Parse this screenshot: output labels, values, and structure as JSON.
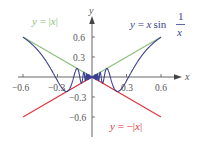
{
  "chart_data": {
    "type": "line",
    "title": "",
    "xlabel": "x",
    "ylabel": "y",
    "xlim": [
      -0.65,
      0.65
    ],
    "ylim": [
      -0.7,
      0.75
    ],
    "grid": false,
    "x_ticks": [
      -0.6,
      -0.3,
      0.3,
      0.6
    ],
    "x_tick_labels": [
      "−0.6",
      "−0.3",
      "0.3",
      "0.6"
    ],
    "y_ticks": [
      0.6,
      0.3,
      -0.3,
      -0.6
    ],
    "y_tick_labels": [
      "0.6",
      "0.3",
      "−0.3",
      "−0.6"
    ],
    "series": [
      {
        "name": "y = |x|",
        "function": "abs(x)",
        "domain": [
          -0.6,
          0.6
        ],
        "color": "#8dc07a"
      },
      {
        "name": "y = −|x|",
        "function": "-abs(x)",
        "domain": [
          -0.6,
          0.6
        ],
        "color": "#e0343c"
      },
      {
        "name": "y = x sin(1/x)",
        "function": "x*sin(1/x)",
        "domain": [
          -0.6,
          0.6
        ],
        "color": "#3a3f8f"
      }
    ],
    "annotations": [
      {
        "text": "y = |x|",
        "color": "#8dc07a",
        "position": "upper-left"
      },
      {
        "text": "y = x sin 1/x",
        "color": "#3a3f8f",
        "position": "upper-right"
      },
      {
        "text": "y = −|x|",
        "color": "#e0343c",
        "position": "lower-right"
      }
    ]
  },
  "labels": {
    "x_axis": "x",
    "y_axis": "y",
    "eq_abs": {
      "y": "y",
      "eq": " = |",
      "x": "x",
      "close": "|"
    },
    "eq_neg_abs": {
      "y": "y",
      "eq": " = −|",
      "x": "x",
      "close": "|"
    },
    "eq_xsin": {
      "y": "y",
      "eq": " = ",
      "x": "x",
      "sin": "sin",
      "num": "1",
      "den": "x"
    },
    "ticks_x": [
      "−0.6",
      "−0.3",
      "0.3",
      "0.6"
    ],
    "ticks_y": [
      "0.6",
      "0.3",
      "−0.3",
      "−0.6"
    ]
  },
  "colors": {
    "abs": "#8dc07a",
    "neg_abs": "#e0343c",
    "xsin": "#3a3f8f",
    "axis": "#555555"
  }
}
